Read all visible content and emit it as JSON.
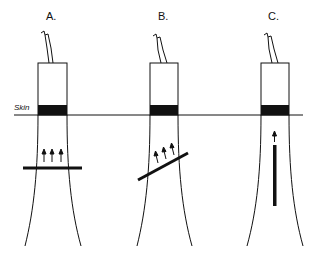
{
  "diagram": {
    "skin_label": "Skin",
    "panels": [
      {
        "label": "A.",
        "bar_orientation": "horizontal",
        "arrow_count": 3
      },
      {
        "label": "B.",
        "bar_orientation": "oblique",
        "arrow_count": 3
      },
      {
        "label": "C.",
        "bar_orientation": "vertical",
        "arrow_count": 1
      }
    ],
    "colors": {
      "ink": "#111111",
      "background": "#ffffff"
    }
  }
}
